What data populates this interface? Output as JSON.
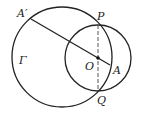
{
  "diagram": {
    "labels": {
      "A_prime": "A′",
      "P": "P",
      "Gamma": "Γ",
      "O": "O",
      "A": "A",
      "Q": "Q"
    },
    "elements": {
      "circle_gamma": {
        "cx": 62,
        "cy": 57,
        "r": 50
      },
      "circle_O": {
        "cx": 98,
        "cy": 58,
        "r": 33
      },
      "segment_A_prime_A": {
        "x1": 31,
        "y1": 19,
        "x2": 110,
        "y2": 65
      },
      "dashed_PQ": {
        "x1": 98,
        "y1": 25,
        "x2": 98,
        "y2": 91
      },
      "point_O": {
        "x": 98,
        "y": 58
      }
    },
    "colors": {
      "stroke": "#222222",
      "background": "#ffffff"
    }
  }
}
